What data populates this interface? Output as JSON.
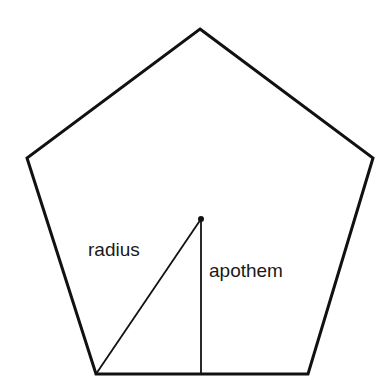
{
  "diagram": {
    "stroke_color": "#111111",
    "background": "#ffffff",
    "pentagon": {
      "points": [
        [
          200,
          29
        ],
        [
          373,
          158
        ],
        [
          308,
          374
        ],
        [
          96,
          374
        ],
        [
          27,
          158
        ]
      ]
    },
    "center": {
      "x": 201,
      "y": 219
    },
    "radius": {
      "from": [
        201,
        219
      ],
      "to": [
        96,
        374
      ],
      "label": "radius"
    },
    "apothem": {
      "from": [
        201,
        219
      ],
      "to": [
        201,
        374
      ],
      "label": "apothem"
    },
    "labels": {
      "radius": "radius",
      "apothem": "apothem"
    }
  }
}
